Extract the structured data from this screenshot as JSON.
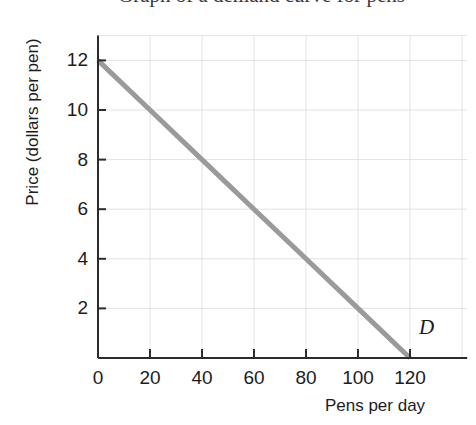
{
  "chart_data": {
    "type": "line",
    "title": "",
    "xlabel": "Pens per day",
    "ylabel": "Price (dollars per pen)",
    "xlim": [
      0,
      140
    ],
    "ylim": [
      0,
      13
    ],
    "xticks": [
      0,
      20,
      40,
      60,
      80,
      100,
      120
    ],
    "xtick_labels": [
      "0",
      "20",
      "40",
      "60",
      "80",
      "100",
      "120"
    ],
    "yticks": [
      2,
      4,
      6,
      8,
      10,
      12
    ],
    "ytick_labels": [
      "2",
      "4",
      "6",
      "8",
      "10",
      "12"
    ],
    "grid": true,
    "legend_position": "inline-annotation",
    "series": [
      {
        "name": "D",
        "label": "D",
        "color": "#9a9a9a",
        "linewidth": 5,
        "x": [
          0,
          20,
          40,
          60,
          80,
          100,
          120
        ],
        "y": [
          12,
          10,
          8,
          6,
          4,
          2,
          0
        ],
        "points": [
          {
            "x": 0,
            "y": 12
          },
          {
            "x": 20,
            "y": 10
          },
          {
            "x": 40,
            "y": 8
          },
          {
            "x": 60,
            "y": 6
          },
          {
            "x": 80,
            "y": 4
          },
          {
            "x": 100,
            "y": 2
          },
          {
            "x": 120,
            "y": 0
          }
        ]
      }
    ],
    "annotations": [
      {
        "text": "D",
        "x": 125,
        "y": 1.1,
        "style": "italic"
      }
    ]
  },
  "colors": {
    "curve": "#9a9a9a",
    "axis": "#2b2b2b",
    "grid": "#e2e2e2",
    "text": "#1c1c1c",
    "background": "#ffffff"
  },
  "top_crop": {
    "remnant_text": "Graph of a demand curve for pens"
  }
}
